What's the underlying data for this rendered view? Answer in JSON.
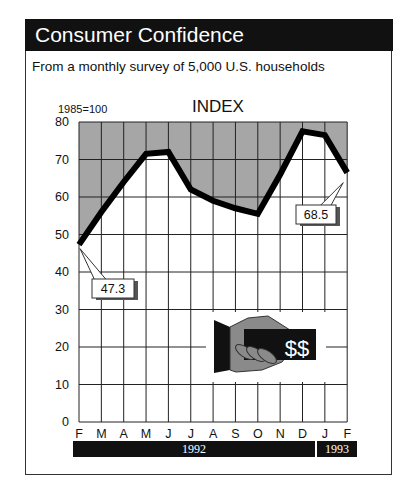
{
  "header": {
    "title": "Consumer Confidence"
  },
  "subtitle": "From a monthly survey of 5,000 U.S. households",
  "baseline_note": "1985=100",
  "chart_title": "INDEX",
  "callouts": {
    "start": "47.3",
    "end": "68.5"
  },
  "years": [
    {
      "label": "1992"
    },
    {
      "label": "1993"
    }
  ],
  "icon": {
    "name": "hand-with-money-icon",
    "text": "$$"
  },
  "colors": {
    "header_bg": "#111111",
    "shade": "#a6a6a6",
    "line": "#000000",
    "grid": "#222222"
  },
  "chart_data": {
    "type": "line",
    "title": "INDEX",
    "subtitle": "From a monthly survey of 5,000 U.S. households",
    "ylabel": "1985=100",
    "xlabel": "",
    "categories": [
      "F",
      "M",
      "A",
      "M",
      "J",
      "J",
      "A",
      "S",
      "O",
      "N",
      "D",
      "J",
      "F"
    ],
    "year_groups": [
      {
        "label": "1992",
        "months": "F–D"
      },
      {
        "label": "1993",
        "months": "J–F"
      }
    ],
    "series": [
      {
        "name": "Consumer Confidence Index",
        "values": [
          47.3,
          56,
          64,
          71.5,
          72,
          62,
          59,
          57,
          55.5,
          66,
          77.5,
          76.5,
          68.5
        ]
      }
    ],
    "annotations": [
      {
        "x": "F 1992",
        "text": "47.3"
      },
      {
        "x": "F 1993",
        "text": "68.5"
      }
    ],
    "ylim": [
      0,
      80
    ],
    "yticks": [
      0,
      10,
      20,
      30,
      40,
      50,
      60,
      70,
      80
    ],
    "grid": true,
    "area_above_line_shaded": true
  }
}
